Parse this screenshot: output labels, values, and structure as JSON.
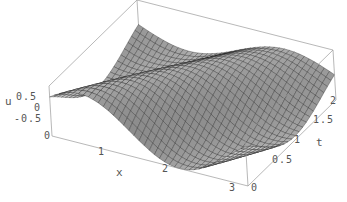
{
  "chart_data": {
    "type": "surface3d",
    "title": "",
    "xlabel": "x",
    "ylabel": "t",
    "zlabel": "u",
    "xlim": [
      0,
      3
    ],
    "ylim": [
      0,
      2
    ],
    "zlim": [
      -0.5,
      0.5
    ],
    "x_ticks": [
      "0",
      "1",
      "2",
      "3"
    ],
    "t_ticks": [
      "0",
      "0.5",
      "1",
      "1.5",
      "2"
    ],
    "u_ticks": [
      "-0.5",
      "0",
      "0.5"
    ],
    "surface": "wave-like traveling surface u(x,t) with ridges running diagonally, amplitude ~0.5",
    "mesh": true,
    "shading": "grayscale",
    "box": true
  },
  "labels": {
    "u_axis": "u",
    "x_axis": "x",
    "t_axis": "t",
    "u_ticks": [
      {
        "text": "0.5",
        "x": 16,
        "y": 92
      },
      {
        "text": "0",
        "x": 34,
        "y": 103
      },
      {
        "text": "-0.5",
        "x": 14,
        "y": 114
      },
      {
        "text": "0",
        "x": 44,
        "y": 131
      }
    ],
    "x_ticks": [
      {
        "text": "1",
        "x": 98,
        "y": 147
      },
      {
        "text": "2",
        "x": 162,
        "y": 164
      },
      {
        "text": "3",
        "x": 229,
        "y": 183
      }
    ],
    "t_ticks": [
      {
        "text": "0",
        "x": 251,
        "y": 183
      },
      {
        "text": "0.5",
        "x": 272,
        "y": 155
      },
      {
        "text": "1",
        "x": 294,
        "y": 135
      },
      {
        "text": "1.5",
        "x": 313,
        "y": 115
      },
      {
        "text": "2",
        "x": 330,
        "y": 96
      }
    ]
  }
}
